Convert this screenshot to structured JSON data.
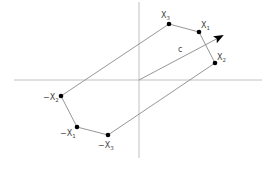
{
  "diagram": {
    "type": "centrally-symmetric hexagon with vector",
    "colors": {
      "line": "#8a8a8a",
      "axis": "#b0b0b0",
      "vertex": "#000000",
      "text": "#444444"
    },
    "axes": {
      "horizontal": {
        "x1": 14,
        "y1": 80,
        "x2": 262,
        "y2": 80
      },
      "vertical": {
        "x1": 139,
        "y1": 2,
        "x2": 139,
        "y2": 158
      }
    },
    "vertices": [
      {
        "id": "x3",
        "base": "X",
        "prefix": "",
        "sub": "3",
        "x": 169,
        "y": 24,
        "lx": 161,
        "ly": 18
      },
      {
        "id": "x1",
        "base": "X",
        "prefix": "",
        "sub": "1",
        "x": 199,
        "y": 32,
        "lx": 201,
        "ly": 28
      },
      {
        "id": "x2",
        "base": "X",
        "prefix": "",
        "sub": "2",
        "x": 215,
        "y": 63,
        "lx": 217,
        "ly": 60
      },
      {
        "id": "neg-x3",
        "base": "X",
        "prefix": "−",
        "sub": "3",
        "x": 108,
        "y": 135,
        "lx": 98,
        "ly": 148
      },
      {
        "id": "neg-x1",
        "base": "X",
        "prefix": "−",
        "sub": "1",
        "x": 77,
        "y": 127,
        "lx": 60,
        "ly": 136
      },
      {
        "id": "neg-x2",
        "base": "X",
        "prefix": "−",
        "sub": "2",
        "x": 61,
        "y": 96,
        "lx": 43,
        "ly": 100
      }
    ],
    "vector": {
      "label": "c",
      "x1": 139,
      "y1": 80,
      "x2": 222,
      "y2": 36,
      "lx": 178,
      "ly": 52
    }
  }
}
